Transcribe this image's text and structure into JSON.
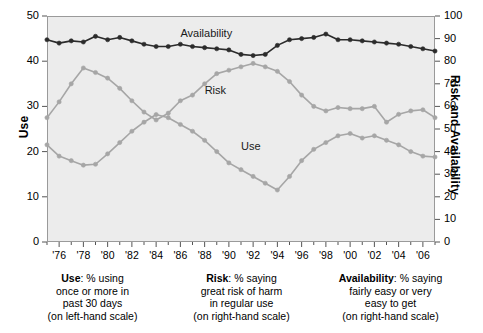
{
  "chart_data": {
    "type": "line",
    "title": "",
    "xlabel": "",
    "ylabel": "Use",
    "y2label": "Risk and Availability",
    "xlim": [
      1975,
      2007
    ],
    "ylim": [
      0,
      50
    ],
    "y2lim": [
      0,
      100
    ],
    "grid": false,
    "legend": "in-plot labels",
    "x": [
      1975,
      1976,
      1977,
      1978,
      1979,
      1980,
      1981,
      1982,
      1983,
      1984,
      1985,
      1986,
      1987,
      1988,
      1989,
      1990,
      1991,
      1992,
      1993,
      1994,
      1995,
      1996,
      1997,
      1998,
      1999,
      2000,
      2001,
      2002,
      2003,
      2004,
      2005,
      2006,
      2007
    ],
    "x_tick_labels": [
      "'76",
      "'78",
      "'80",
      "'82",
      "'84",
      "'86",
      "'88",
      "'90",
      "'92",
      "'94",
      "'96",
      "'98",
      "'00",
      "'02",
      "'04",
      "'06"
    ],
    "x_tick_values": [
      1976,
      1978,
      1980,
      1982,
      1984,
      1986,
      1988,
      1990,
      1992,
      1994,
      1996,
      1998,
      2000,
      2002,
      2004,
      2006
    ],
    "y_tick_labels": [
      "0",
      "10",
      "20",
      "30",
      "40",
      "50"
    ],
    "y_tick_values": [
      0,
      10,
      20,
      30,
      40,
      50
    ],
    "y2_tick_labels": [
      "0",
      "10",
      "20",
      "30",
      "40",
      "50",
      "60",
      "70",
      "80",
      "90",
      "100"
    ],
    "y2_tick_values": [
      0,
      10,
      20,
      30,
      40,
      50,
      60,
      70,
      80,
      90,
      100
    ],
    "series": [
      {
        "name": "Use",
        "axis": "left",
        "color": "#a6a6a6",
        "label_x": 1991,
        "label_y": 21.0,
        "values": [
          21.5,
          19.0,
          18.0,
          17.0,
          17.2,
          19.5,
          22.0,
          24.5,
          26.5,
          28.2,
          27.5,
          26.0,
          24.5,
          22.5,
          20.0,
          17.5,
          16.0,
          14.5,
          13.0,
          11.5,
          14.5,
          18.0,
          20.5,
          22.0,
          23.5,
          24.0,
          23.0,
          23.5,
          22.5,
          21.5,
          20.0,
          19.0,
          18.8
        ]
      },
      {
        "name": "Risk",
        "axis": "right",
        "color": "#a6a6a6",
        "label_x": 1988,
        "label_y": 67.0,
        "values": [
          55.0,
          62.0,
          70.0,
          77.0,
          75.0,
          72.5,
          68.0,
          62.5,
          57.5,
          54.0,
          57.0,
          62.5,
          65.0,
          70.0,
          74.5,
          76.0,
          77.5,
          79.0,
          77.5,
          75.5,
          71.0,
          65.0,
          60.0,
          58.0,
          59.5,
          59.0,
          59.0,
          60.0,
          53.0,
          56.5,
          58.0,
          58.5,
          55.0
        ]
      },
      {
        "name": "Availability",
        "axis": "right",
        "color": "#2b2b2b",
        "label_x": 1986,
        "label_y": 92.0,
        "values": [
          89.5,
          88.0,
          89.0,
          88.5,
          91.0,
          89.5,
          90.5,
          89.0,
          87.5,
          86.5,
          86.5,
          87.5,
          86.5,
          86.0,
          85.5,
          85.0,
          83.0,
          82.5,
          83.0,
          87.0,
          89.5,
          90.0,
          90.5,
          92.0,
          89.5,
          89.5,
          89.0,
          88.5,
          88.0,
          87.5,
          86.5,
          85.5,
          84.5
        ]
      }
    ]
  },
  "left_axis": {
    "title": "Use"
  },
  "right_axis": {
    "title": "Risk and Availability"
  },
  "captions": [
    {
      "name": "use",
      "bold": "Use",
      "lines": [
        ": % using",
        "once or more in",
        "past 30 days",
        "(on left-hand scale)"
      ]
    },
    {
      "name": "risk",
      "bold": "Risk",
      "lines": [
        ": % saying",
        "great risk of harm",
        "in regular use",
        "(on right-hand scale)"
      ]
    },
    {
      "name": "availability",
      "bold": "Availability",
      "lines": [
        ": % saying",
        "fairly easy or very",
        "easy to get",
        "(on right-hand scale)"
      ]
    }
  ]
}
